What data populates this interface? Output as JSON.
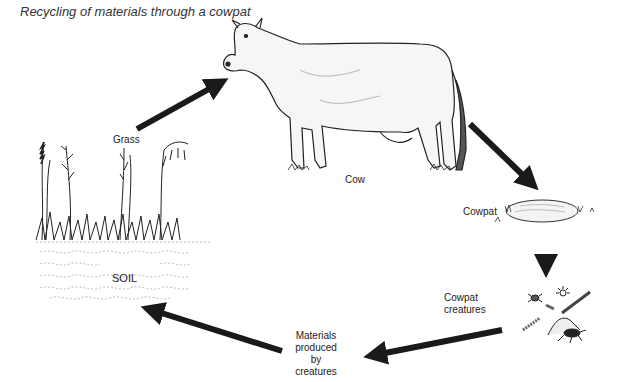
{
  "title": "Recycling of materials through a cowpat",
  "labels": {
    "grass": "Grass",
    "cow": "Cow",
    "cowpat": "Cowpat",
    "soil": "SOIL",
    "cowpat_creatures_line1": "Cowpat",
    "cowpat_creatures_line2": "creatures",
    "materials_line1": "Materials",
    "materials_line2": "produced",
    "materials_line3": "by",
    "materials_line4": "creatures"
  },
  "cycle": [
    {
      "from": "Grass",
      "to": "Cow"
    },
    {
      "from": "Cow",
      "to": "Cowpat"
    },
    {
      "from": "Cowpat",
      "to": "Cowpat creatures"
    },
    {
      "from": "Cowpat creatures",
      "to": "Materials produced by creatures"
    },
    {
      "from": "Materials produced by creatures",
      "to": "SOIL"
    }
  ],
  "colors": {
    "ink": "#222222",
    "arrow": "#1a1a1a",
    "background": "#ffffff"
  }
}
